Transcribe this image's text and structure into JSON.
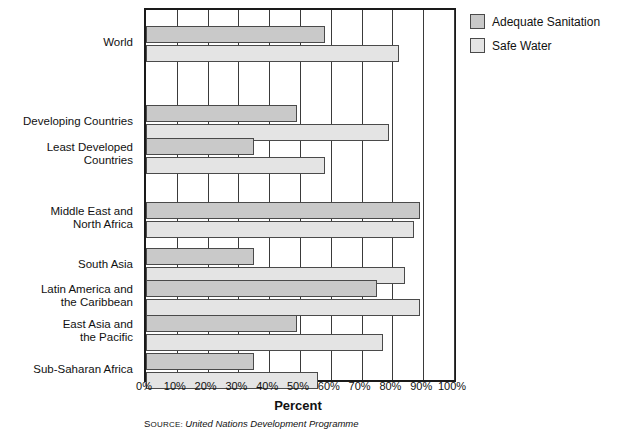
{
  "chart_data": {
    "type": "bar",
    "orientation": "horizontal",
    "title": "",
    "xlabel": "Percent",
    "ylabel": "",
    "xlim": [
      0,
      100
    ],
    "xticks": [
      "0%",
      "10%",
      "20%",
      "30%",
      "40%",
      "50%",
      "60%",
      "70%",
      "80%",
      "90%",
      "100%"
    ],
    "xtick_values": [
      0,
      10,
      20,
      30,
      40,
      50,
      60,
      70,
      80,
      90,
      100
    ],
    "grid": true,
    "grid_axis": "x",
    "legend_position": "right-top",
    "categories": [
      "World",
      "Developing Countries",
      "Least Developed\nCountries",
      "Middle East and\nNorth Africa",
      "South Asia",
      "Latin America and\nthe Caribbean",
      "East Asia and\nthe Pacific",
      "Sub-Saharan Africa"
    ],
    "series": [
      {
        "name": "Adequate Sanitation",
        "color": "#c9c9c9",
        "values": [
          58,
          49,
          35,
          89,
          35,
          75,
          49,
          35
        ]
      },
      {
        "name": "Safe Water",
        "color": "#e4e4e4",
        "values": [
          82,
          79,
          58,
          87,
          84,
          89,
          77,
          56
        ]
      }
    ],
    "source": {
      "keyword": "Source:",
      "text": "United Nations Development Programme"
    }
  },
  "legend": {
    "items": [
      {
        "label": "Adequate Sanitation",
        "color": "#c9c9c9"
      },
      {
        "label": "Safe Water",
        "color": "#e4e4e4"
      }
    ]
  },
  "axis": {
    "x_title": "Percent"
  }
}
